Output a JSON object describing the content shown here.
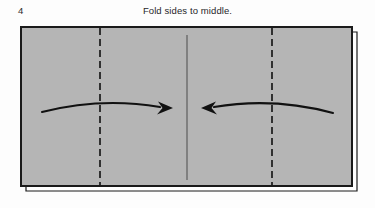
{
  "figure": {
    "step_number": "4",
    "caption": "Fold sides to middle.",
    "colors": {
      "paper_fill": "#b5b5b5",
      "outline": "#1a1a1a",
      "fold_line": "#1a1a1a",
      "center_line": "#555555",
      "arrow": "#111111",
      "background": "#fdfdfd",
      "under_layer_fill": "#ffffff"
    },
    "paper": {
      "shape": "rectangle",
      "left": 21,
      "top": 27,
      "right": 352,
      "bottom": 186,
      "width": 331,
      "height": 159,
      "layered_edge": {
        "present": true,
        "side": "right",
        "offset_x": 5,
        "offset_y": 5
      }
    },
    "fold_lines": [
      {
        "name": "left-fold-line",
        "style": "dashed",
        "orientation": "vertical",
        "x": 100,
        "y_top": 28,
        "y_bottom": 186
      },
      {
        "name": "right-fold-line",
        "style": "dashed",
        "orientation": "vertical",
        "x": 272,
        "y_top": 28,
        "y_bottom": 186
      }
    ],
    "center_line": {
      "name": "center-crease-line",
      "style": "solid",
      "orientation": "vertical",
      "x": 187,
      "y_top": 35,
      "y_bottom": 180
    },
    "arrows": [
      {
        "name": "left-fold-arrow",
        "direction": "right",
        "start_x": 42,
        "start_y": 112,
        "end_x": 173,
        "end_y": 108,
        "curve": "arc-up",
        "arrowhead": "filled-triangle"
      },
      {
        "name": "right-fold-arrow",
        "direction": "left",
        "start_x": 333,
        "start_y": 113,
        "end_x": 201,
        "end_y": 108,
        "curve": "arc-up",
        "arrowhead": "filled-triangle"
      }
    ]
  }
}
